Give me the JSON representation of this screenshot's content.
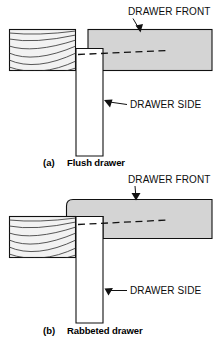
{
  "figure": {
    "colors": {
      "front_panel_fill": "#d4d4d4",
      "side_panel_fill": "#ffffff",
      "cabinet_fill": "#f2f2f2",
      "line": "#111111",
      "grain": "#3a3a3a",
      "background": "#ffffff"
    }
  },
  "panels": [
    {
      "id": "flush",
      "caption_index": "(a)",
      "caption_label": "Flush drawer",
      "labels": [
        {
          "id": "drawer-front",
          "text": "DRAWER FRONT"
        },
        {
          "id": "drawer-side",
          "text": "DRAWER SIDE"
        }
      ],
      "parts": [
        {
          "id": "cabinet-side",
          "name": "cabinet side",
          "hatched": true
        },
        {
          "id": "drawer-front-panel",
          "name": "drawer front"
        },
        {
          "id": "drawer-side-panel",
          "name": "drawer side"
        }
      ]
    },
    {
      "id": "rabbeted",
      "caption_index": "(b)",
      "caption_label": "Rabbeted drawer",
      "labels": [
        {
          "id": "drawer-front",
          "text": "DRAWER FRONT"
        },
        {
          "id": "drawer-side",
          "text": "DRAWER SIDE"
        }
      ],
      "parts": [
        {
          "id": "cabinet-side",
          "name": "cabinet side",
          "hatched": true
        },
        {
          "id": "drawer-front-panel",
          "name": "drawer front"
        },
        {
          "id": "drawer-side-panel",
          "name": "drawer side"
        }
      ]
    }
  ]
}
